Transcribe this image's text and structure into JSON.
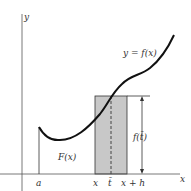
{
  "diagram": {
    "axes": {
      "x_label": "x",
      "y_label": "y"
    },
    "curve_label": "y = f(x)",
    "area_label": "F(x)",
    "height_label": "f(t̄)",
    "tick_labels": {
      "a": "a",
      "x": "x",
      "t_bar": "t̄",
      "x_plus_h": "x + h"
    },
    "colors": {
      "curve": "#111111",
      "rect_fill": "#c8c8c8",
      "axis": "#555555"
    }
  }
}
